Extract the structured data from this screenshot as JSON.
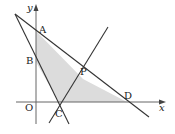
{
  "figure": {
    "axes": {
      "x_label": "x",
      "y_label": "y",
      "origin_label": "O"
    },
    "points": {
      "A": {
        "label": "A",
        "x": 36,
        "y": 31
      },
      "B": {
        "label": "B",
        "x": 36,
        "y": 62
      },
      "C": {
        "label": "C",
        "x": 59,
        "y": 102
      },
      "D": {
        "label": "D",
        "x": 127,
        "y": 102
      },
      "P": {
        "label": "P",
        "x": 83,
        "y": 79
      }
    },
    "colors": {
      "line": "#333333",
      "shade": "#d9d9d9",
      "axis": "#555555"
    }
  }
}
